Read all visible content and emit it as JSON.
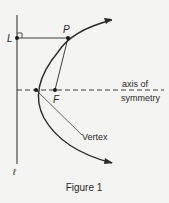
{
  "figure": {
    "caption": "Figure 1",
    "labels": {
      "directrix": "ℓ",
      "point_l": "L",
      "point_p": "P",
      "focus": "F",
      "vertex": "Vertex",
      "axis_line1": "axis of",
      "axis_line2": "symmetry"
    },
    "colors": {
      "ink": "#2a2a2a",
      "background": "#f4f4f2"
    }
  }
}
